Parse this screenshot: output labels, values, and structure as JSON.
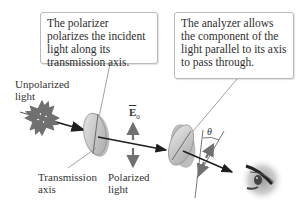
{
  "callouts": {
    "polarizer": "The polarizer polarizes the incident light along its transmission axis.",
    "analyzer": "The analyzer allows the component of the light parallel to its axis to pass through."
  },
  "labels": {
    "unpolarized_line1": "Unpolarized",
    "unpolarized_line2": "light",
    "transmission_line1": "Transmission",
    "transmission_line2": "axis",
    "polarized_line1": "Polarized",
    "polarized_line2": "light",
    "field_vector": "E",
    "field_subscript": "0",
    "angle": "θ"
  },
  "icons": {
    "source": "starburst-icon",
    "polarizer": "polarizer-disk-icon",
    "analyzer": "analyzer-disk-icon",
    "observer": "eye-icon"
  },
  "colors": {
    "arrow": "#6f6f6f",
    "beam": "#1e1e1e",
    "disk": "#c9c9c9",
    "box_border": "#b9b9b9"
  }
}
